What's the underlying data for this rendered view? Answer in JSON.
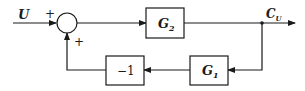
{
  "diagram": {
    "type": "block-diagram",
    "input": {
      "label": "U"
    },
    "output": {
      "label": "C",
      "subscript": "U"
    },
    "summing_junction": {
      "signs": {
        "top_left": "+",
        "bottom": "+"
      }
    },
    "blocks": [
      {
        "id": "g2",
        "label": "G",
        "subscript": "2",
        "position": "forward path"
      },
      {
        "id": "g1",
        "label": "G",
        "subscript": "1",
        "position": "feedback path"
      },
      {
        "id": "neg1",
        "label": "−1",
        "position": "feedback path"
      }
    ],
    "colors": {
      "stroke": "#1a1a1a",
      "background": "#ffffff"
    }
  }
}
